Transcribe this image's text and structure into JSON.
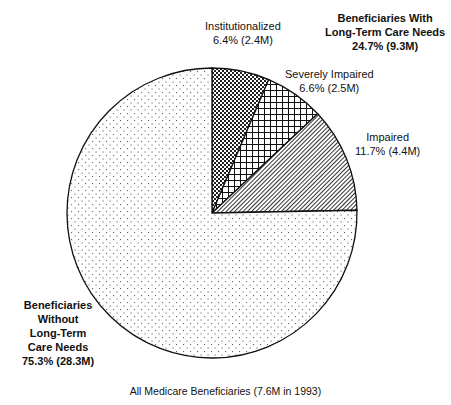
{
  "chart_data": {
    "type": "pie",
    "title": "",
    "caption": "All Medicare Beneficiaries (7.6M in 1993)",
    "start_angle_deg": 0,
    "direction": "clockwise",
    "center": [
      212,
      213
    ],
    "radius": 145,
    "slices": [
      {
        "name": "Institutionalized",
        "percent": 6.4,
        "value_millions": 2.4,
        "pattern": "checker",
        "label_line1": "Institutionalized",
        "label_line2": "6.4% (2.4M)"
      },
      {
        "name": "Severely Impaired",
        "percent": 6.6,
        "value_millions": 2.5,
        "pattern": "crosshatch",
        "label_line1": "Severely Impaired",
        "label_line2": "6.6% (2.5M)"
      },
      {
        "name": "Impaired",
        "percent": 11.7,
        "value_millions": 4.4,
        "pattern": "diagonal",
        "label_line1": "Impaired",
        "label_line2": "11.7% (4.4M)"
      },
      {
        "name": "Beneficiaries Without Long-Term Care Needs",
        "percent": 75.3,
        "value_millions": 28.3,
        "pattern": "dots"
      }
    ],
    "group_labels": {
      "with_ltc": {
        "line1": "Beneficiaries With",
        "line2": "Long-Term Care Needs",
        "line3": "24.7% (9.3M)"
      },
      "without_ltc": {
        "line1": "Beneficiaries",
        "line2": "Without",
        "line3": "Long-Term",
        "line4": "Care Needs",
        "line5": "75.3% (28.3M)"
      }
    },
    "legend": "none (direct labels)"
  },
  "colors": {
    "stroke": "#111111",
    "background": "#ffffff"
  }
}
